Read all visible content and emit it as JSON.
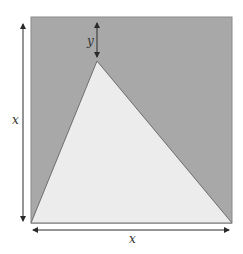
{
  "diagram": {
    "colors": {
      "square_fill": "#a8a8a8",
      "square_stroke": "#8a8a8a",
      "triangle_fill": "#ececec",
      "triangle_stroke": "#6e6e6e",
      "arrow": "#2a2a2a"
    },
    "labels": {
      "side_vertical": "x",
      "side_horizontal": "x",
      "apex_offset": "y"
    }
  }
}
